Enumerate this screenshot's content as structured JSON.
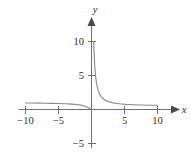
{
  "figure": {
    "width": 191,
    "height": 158,
    "background": "#ffffff",
    "curve_color": "#8c8c8c",
    "axis_color": "#6f6f6f",
    "text_color": "#2b2b2b"
  },
  "labels": {
    "x_axis_name": "x",
    "y_axis_name": "y",
    "x_neg10": "−10",
    "x_neg5": "−5",
    "x_pos5": "5",
    "x_pos10": "10",
    "y_pos5": "5",
    "y_pos10": "10",
    "y_neg5": "−5"
  },
  "chart_data": {
    "type": "line",
    "title": "",
    "xlabel": "x",
    "ylabel": "y",
    "xlim": [
      -11.5,
      11.5
    ],
    "ylim": [
      -7.5,
      12.5
    ],
    "grid": false,
    "legend": null,
    "xticks": [
      -10,
      -5,
      5,
      10
    ],
    "xticklabels": [
      "−10",
      "−5",
      "5",
      "10"
    ],
    "yticks": [
      -5,
      5,
      10
    ],
    "yticklabels": [
      "−5",
      "5",
      "10"
    ],
    "asymptotes": {
      "vertical": 0,
      "horizontal": 0
    },
    "series": [
      {
        "name": "left-branch",
        "comment": "branch for x < 0, lies just above y=0, falls to 0 at x=0",
        "x": [
          -10.0,
          -9.0,
          -8.0,
          -7.0,
          -6.0,
          -5.0,
          -4.0,
          -3.0,
          -2.5,
          -2.0,
          -1.6,
          -1.2,
          -0.9,
          -0.6,
          -0.35,
          -0.15,
          -0.05
        ],
        "y": [
          0.95,
          0.95,
          0.93,
          0.92,
          0.9,
          0.88,
          0.85,
          0.8,
          0.76,
          0.7,
          0.64,
          0.55,
          0.45,
          0.33,
          0.2,
          0.08,
          0.02
        ]
      },
      {
        "name": "right-branch",
        "comment": "branch for x > 0, descends from y=10 near x=0+ toward y=0",
        "x": [
          0.33,
          0.36,
          0.4,
          0.45,
          0.52,
          0.62,
          0.75,
          0.95,
          1.2,
          1.5,
          2.0,
          2.6,
          3.3,
          4.2,
          5.2,
          6.4,
          7.6,
          8.8,
          10.0
        ],
        "y": [
          10.0,
          9.2,
          8.2,
          7.1,
          6.0,
          4.9,
          3.9,
          3.0,
          2.3,
          1.85,
          1.4,
          1.15,
          0.98,
          0.85,
          0.76,
          0.7,
          0.66,
          0.63,
          0.62
        ]
      }
    ]
  }
}
